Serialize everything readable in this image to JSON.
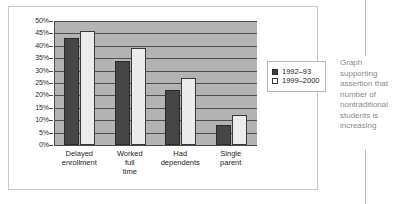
{
  "chart_data": {
    "type": "bar",
    "title": "",
    "xlabel": "",
    "ylabel": "",
    "ylim": [
      0,
      50
    ],
    "ytick_step": 5,
    "grid": true,
    "legend_position": "right",
    "categories": [
      "Delayed enrollment",
      "Worked full time",
      "Had dependents",
      "Single parent"
    ],
    "category_lines": [
      [
        "Delayed",
        "enrollment"
      ],
      [
        "Worked",
        "full",
        "time"
      ],
      [
        "Had",
        "dependents"
      ],
      [
        "Single",
        "parent"
      ]
    ],
    "ytick_labels": [
      "50%",
      "45%",
      "40%",
      "35%",
      "30%",
      "25%",
      "20%",
      "15%",
      "10%",
      "5%",
      "0%"
    ],
    "ytick_values": [
      50,
      45,
      40,
      35,
      30,
      25,
      20,
      15,
      10,
      5,
      0
    ],
    "series": [
      {
        "name": "1992–93",
        "values": [
          43,
          34,
          22,
          8
        ],
        "color": "#464646"
      },
      {
        "name": "1999–2000",
        "values": [
          46,
          39,
          27,
          12
        ],
        "color": "#ebebeb"
      }
    ],
    "plot_background": "#b3b3b3"
  },
  "legend": {
    "entries": [
      {
        "label": "1992–93"
      },
      {
        "label": "1999–2000"
      }
    ]
  },
  "annotation": {
    "text": "Graph supporting assertion that number of nontraditional students is increasing"
  }
}
